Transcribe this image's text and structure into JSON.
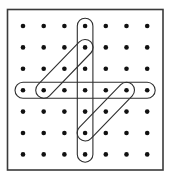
{
  "diagram": {
    "type": "dot-grid-puzzle",
    "grid": {
      "columns": 7,
      "rows": 7,
      "origin_x": 23,
      "origin_y": 26,
      "spacing_x": 20.7,
      "spacing_y": 21.4,
      "dot_radius": 2.3
    },
    "frame": {
      "x": 7.5,
      "y": 9.5,
      "width": 155.5,
      "height": 160.5
    },
    "loops": [
      {
        "name": "vertical-loop",
        "from": [
          3,
          0
        ],
        "to": [
          3,
          6
        ],
        "radius": 7.8
      },
      {
        "name": "horizontal-loop",
        "from": [
          0,
          3
        ],
        "to": [
          6,
          3
        ],
        "radius": 8
      },
      {
        "name": "upper-diagonal-loop",
        "from": [
          1,
          3
        ],
        "to": [
          3,
          1
        ],
        "radius": 8
      },
      {
        "name": "lower-diagonal-loop",
        "from": [
          5,
          3
        ],
        "to": [
          3,
          5
        ],
        "radius": 8
      }
    ],
    "colors": {
      "dot": "#111111",
      "line": "#2e2e2e",
      "frame": "#3a3a3a",
      "background": "#ffffff"
    }
  }
}
